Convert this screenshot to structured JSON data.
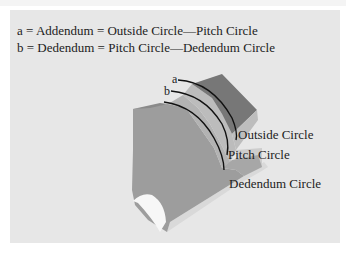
{
  "legend": {
    "line_a": "a = Addendum = Outside Circle—Pitch Circle",
    "line_b": "b = Dedendum = Pitch Circle—Dedendum Circle"
  },
  "labels": {
    "a": "a",
    "b": "b",
    "outside_circle": "Outside Circle",
    "pitch_circle": "Pitch Circle",
    "dedendum_circle": "Dedendum Circle"
  },
  "colors": {
    "panel": "#e7e7e7",
    "tooth_front": "#9c9c9c",
    "tooth_top": "#7a7a7a",
    "tooth_flank": "#b4b4b4",
    "tooth_side": "#cfcfcf",
    "arc": "#111111"
  }
}
